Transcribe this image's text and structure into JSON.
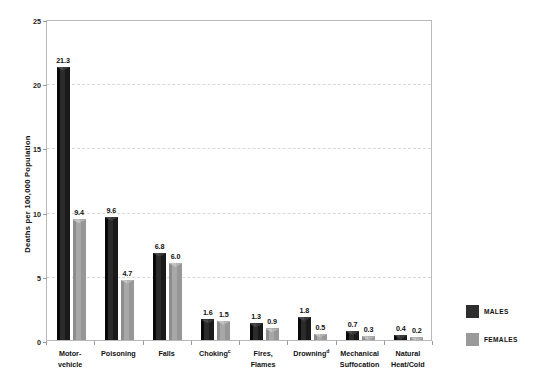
{
  "chart_data": {
    "type": "bar",
    "title": "",
    "xlabel": "",
    "ylabel": "Deaths per 100,000 Population",
    "ylim": [
      0,
      25
    ],
    "yticks": [
      "0",
      "5",
      "10",
      "15",
      "20",
      "25"
    ],
    "grid": true,
    "legend_position": "right",
    "categories": [
      "Motor-vehicle",
      "Poisoning",
      "Falls",
      "Choking",
      "Fires, Flames",
      "Drowning",
      "Mechanical Suffocation",
      "Natural Heat/Cold"
    ],
    "category_lines": [
      [
        "Motor-",
        "vehicle"
      ],
      [
        "Poisoning"
      ],
      [
        "Falls"
      ],
      [
        "Choking"
      ],
      [
        "Fires,",
        "Flames"
      ],
      [
        "Drowning"
      ],
      [
        "Mechanical",
        "Suffocation"
      ],
      [
        "Natural",
        "Heat/Cold"
      ]
    ],
    "category_footnotes": [
      "",
      "",
      "",
      "c",
      "",
      "d",
      "",
      ""
    ],
    "series": [
      {
        "name": "MALES",
        "color": "#2e2e2e",
        "values": [
          21.3,
          9.6,
          6.8,
          1.6,
          1.3,
          1.8,
          0.7,
          0.4
        ],
        "labels": [
          "21.3",
          "9.6",
          "6.8",
          "1.6",
          "1.3",
          "1.8",
          "0.7",
          "0.4"
        ]
      },
      {
        "name": "FEMALES",
        "color": "#9a9a9a",
        "values": [
          9.4,
          4.7,
          6.0,
          1.5,
          0.9,
          0.5,
          0.3,
          0.2
        ],
        "labels": [
          "9.4",
          "4.7",
          "6.0",
          "1.5",
          "0.9",
          "0.5",
          "0.3",
          "0.2"
        ]
      }
    ]
  },
  "legend": {
    "items": [
      {
        "label": "MALES",
        "key": "male"
      },
      {
        "label": "FEMALES",
        "key": "female"
      }
    ]
  }
}
